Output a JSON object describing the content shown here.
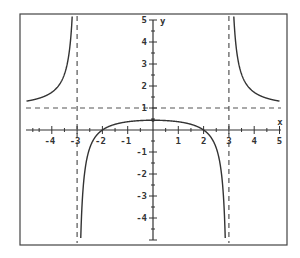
{
  "chart_data": {
    "type": "line",
    "title": "",
    "function": "f(x) = (x^2 - 4) / (x^2 - 9)",
    "xlabel": "x",
    "ylabel": "y",
    "xlim": [
      -5,
      5
    ],
    "ylim": [
      -5,
      5
    ],
    "x_ticks": [
      -4,
      -3,
      -2,
      -1,
      1,
      2,
      3,
      4,
      5
    ],
    "y_ticks": [
      5,
      4,
      3,
      2,
      1,
      -1,
      -2,
      -3,
      -4
    ],
    "grid": false,
    "asymptotes": {
      "vertical": [
        -3,
        3
      ],
      "horizontal": [
        1
      ]
    },
    "key_points": [
      {
        "x": -2,
        "y": 0
      },
      {
        "x": 2,
        "y": 0
      },
      {
        "x": 0,
        "y": 0.444
      }
    ],
    "series": [
      {
        "name": "left branch",
        "x_range": [
          -5,
          -3.01
        ]
      },
      {
        "name": "middle branch",
        "x_range": [
          -2.99,
          2.99
        ]
      },
      {
        "name": "right branch",
        "x_range": [
          3.01,
          5
        ]
      }
    ],
    "sample_points": [
      {
        "x": -4.94,
        "y": 1.32
      },
      {
        "x": -4,
        "y": 1.71
      },
      {
        "x": -3.5,
        "y": 2.54
      },
      {
        "x": -2.5,
        "y": -0.82
      },
      {
        "x": -1,
        "y": 0.375
      },
      {
        "x": 0,
        "y": 0.444
      },
      {
        "x": 1,
        "y": 0.375
      },
      {
        "x": 2.5,
        "y": -0.82
      },
      {
        "x": 3.5,
        "y": 2.54
      },
      {
        "x": 4,
        "y": 1.71
      }
    ]
  },
  "colors": {
    "curve": "#333333",
    "axis": "#333333",
    "dashed": "#555555",
    "frame": "#444444"
  }
}
